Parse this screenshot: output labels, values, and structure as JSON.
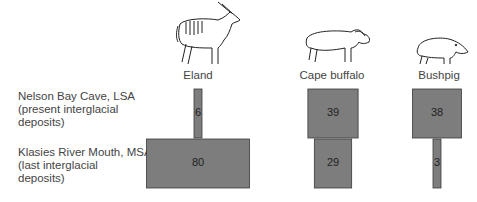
{
  "chart_data": {
    "type": "bar",
    "title": "",
    "categories": [
      "Eland",
      "Cape buffalo",
      "Bushpig"
    ],
    "series": [
      {
        "name": "Nelson Bay Cave, LSA (present interglacial deposits)",
        "values": [
          6,
          39,
          38
        ]
      },
      {
        "name": "Klasies River Mouth, MSA (last interglacial deposits)",
        "values": [
          80,
          29,
          3
        ]
      }
    ],
    "row_labels": [
      [
        "Nelson Bay Cave, LSA",
        "(present interglacial",
        "deposits)"
      ],
      [
        "Klasies River Mouth, MSA",
        "(last interglacial",
        "deposits)"
      ]
    ],
    "xlabel": "",
    "ylabel": "",
    "colors": {
      "bar": "#7d7d7d",
      "outline": "#3a3a3a"
    }
  },
  "animals": [
    {
      "name": "Eland",
      "icon": "eland-icon"
    },
    {
      "name": "Cape buffalo",
      "icon": "cape-buffalo-icon"
    },
    {
      "name": "Bushpig",
      "icon": "bushpig-icon"
    }
  ]
}
